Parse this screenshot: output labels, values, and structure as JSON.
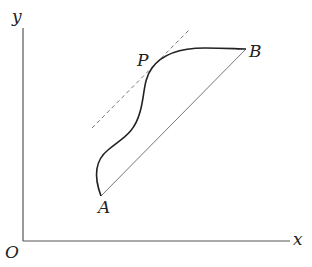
{
  "diagram": {
    "labels": {
      "y_axis": "y",
      "x_axis": "x",
      "origin": "O",
      "point_a": "A",
      "point_b": "B",
      "point_p": "P"
    },
    "elements": [
      "coordinate axes with origin O",
      "curve from A to B through P",
      "chord AB (straight line)",
      "dashed tangent line at P parallel to AB"
    ],
    "colors": {
      "axis": "#555555",
      "curve": "#222222",
      "chord": "#777777",
      "tangent": "#777777"
    }
  }
}
